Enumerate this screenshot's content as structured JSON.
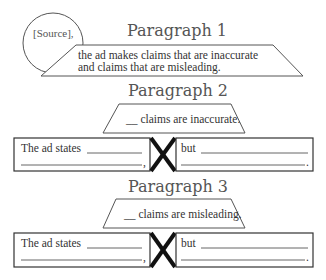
{
  "paragraph1": {
    "heading": "Paragraph 1",
    "source_label": "[Source],",
    "line1": "the ad makes claims that are inaccurate",
    "line2": "and claims that are misleading."
  },
  "paragraph2": {
    "heading": "Paragraph 2",
    "topic": "__ claims are inaccurate.",
    "left_box": {
      "lead": "The ad states",
      "end_punct": ","
    },
    "connector_icon": "x-mark-icon",
    "right_box": {
      "lead": "but",
      "end_punct": "."
    }
  },
  "paragraph3": {
    "heading": "Paragraph 3",
    "topic": "__ claims are misleading.",
    "left_box": {
      "lead": "The ad states",
      "end_punct": ","
    },
    "connector_icon": "x-mark-icon",
    "right_box": {
      "lead": "but",
      "end_punct": "."
    }
  },
  "colors": {
    "heading": "#555555",
    "text": "#333333",
    "x_mark": "#111111",
    "background": "#ffffff"
  }
}
